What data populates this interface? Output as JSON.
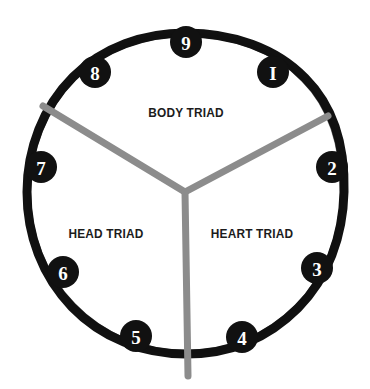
{
  "diagram": {
    "name": "Enneagram Triad Circle",
    "type": "enneagram-triad-wheel",
    "background_color": "#ffffff",
    "ring_color": "#111111",
    "node_fill_color": "#111111",
    "node_text_color": "#ffffff",
    "divider_color": "#8c8c8c",
    "label_color": "#1c1c1c",
    "center": {
      "x": 185,
      "y": 192
    },
    "ring_radius": 159,
    "ring_stroke_width": 9,
    "node_radius": 15,
    "divider_stroke_width": 7,
    "divider_junction": {
      "x": 185,
      "y": 192
    }
  },
  "triads": [
    {
      "id": "body-triad",
      "label": "BODY TRIAD",
      "label_x": 186,
      "label_y": 113,
      "members": [
        "8",
        "9",
        "1"
      ]
    },
    {
      "id": "head-triad",
      "label": "HEAD TRIAD",
      "label_x": 106,
      "label_y": 234,
      "members": [
        "5",
        "6",
        "7"
      ]
    },
    {
      "id": "heart-triad",
      "label": "HEART TRIAD",
      "label_x": 252,
      "label_y": 234,
      "members": [
        "2",
        "3",
        "4"
      ]
    }
  ],
  "nodes": [
    {
      "id": "node-1",
      "label": "1",
      "glyph": "I",
      "x": 273,
      "y": 72,
      "angle_deg": -50
    },
    {
      "id": "node-2",
      "label": "2",
      "glyph": "2",
      "x": 332,
      "y": 167,
      "angle_deg": -8
    },
    {
      "id": "node-3",
      "label": "3",
      "glyph": "3",
      "x": 317,
      "y": 268,
      "angle_deg": 31
    },
    {
      "id": "node-4",
      "label": "4",
      "glyph": "4",
      "x": 242,
      "y": 337,
      "angle_deg": 70
    },
    {
      "id": "node-5",
      "label": "5",
      "glyph": "5",
      "x": 136,
      "y": 336,
      "angle_deg": 110
    },
    {
      "id": "node-6",
      "label": "6",
      "glyph": "6",
      "x": 63,
      "y": 272,
      "angle_deg": 150
    },
    {
      "id": "node-7",
      "label": "7",
      "glyph": "7",
      "x": 41,
      "y": 167,
      "angle_deg": 189
    },
    {
      "id": "node-8",
      "label": "8",
      "glyph": "8",
      "x": 95,
      "y": 72,
      "angle_deg": 230
    },
    {
      "id": "node-9",
      "label": "9",
      "glyph": "9",
      "x": 186,
      "y": 42,
      "angle_deg": 270
    }
  ],
  "dividers": [
    {
      "id": "divider-upper-left",
      "from_x": 185,
      "from_y": 192,
      "to_x": 43,
      "to_y": 106
    },
    {
      "id": "divider-upper-right",
      "from_x": 185,
      "from_y": 192,
      "to_x": 328,
      "to_y": 116
    },
    {
      "id": "divider-bottom",
      "from_x": 185,
      "from_y": 192,
      "to_x": 188,
      "to_y": 376
    }
  ]
}
